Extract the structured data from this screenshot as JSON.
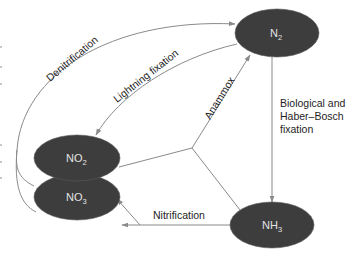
{
  "diagram": {
    "nodes": {
      "n2": {
        "base": "N",
        "sub": "2"
      },
      "no2": {
        "base": "NO",
        "sub": "2"
      },
      "no3": {
        "base": "NO",
        "sub": "3"
      },
      "nh3": {
        "base": "NH",
        "sub": "3"
      }
    },
    "edges": {
      "denitrification": {
        "label": "Denitrification",
        "from": "NO3",
        "to": "N2"
      },
      "lightning_fixation": {
        "label": "Lightning fixation",
        "from": "N2",
        "to": "NO2"
      },
      "anammox": {
        "label": "Anammox",
        "from": [
          "NO2",
          "NH3"
        ],
        "to": "N2"
      },
      "biological_fixation": {
        "label_lines": [
          "Biological and",
          "Haber–Bosch",
          "fixation"
        ],
        "from": "N2",
        "to": "NH3"
      },
      "nitrification": {
        "label": "Nitrification",
        "from": "NH3",
        "to": [
          "NO3",
          "NO2"
        ]
      }
    },
    "colors": {
      "node_fill": "#3d3d3d",
      "node_text": "#e4e4e4",
      "edge": "#8a8a8a",
      "label_text": "#1e1e1e"
    }
  }
}
